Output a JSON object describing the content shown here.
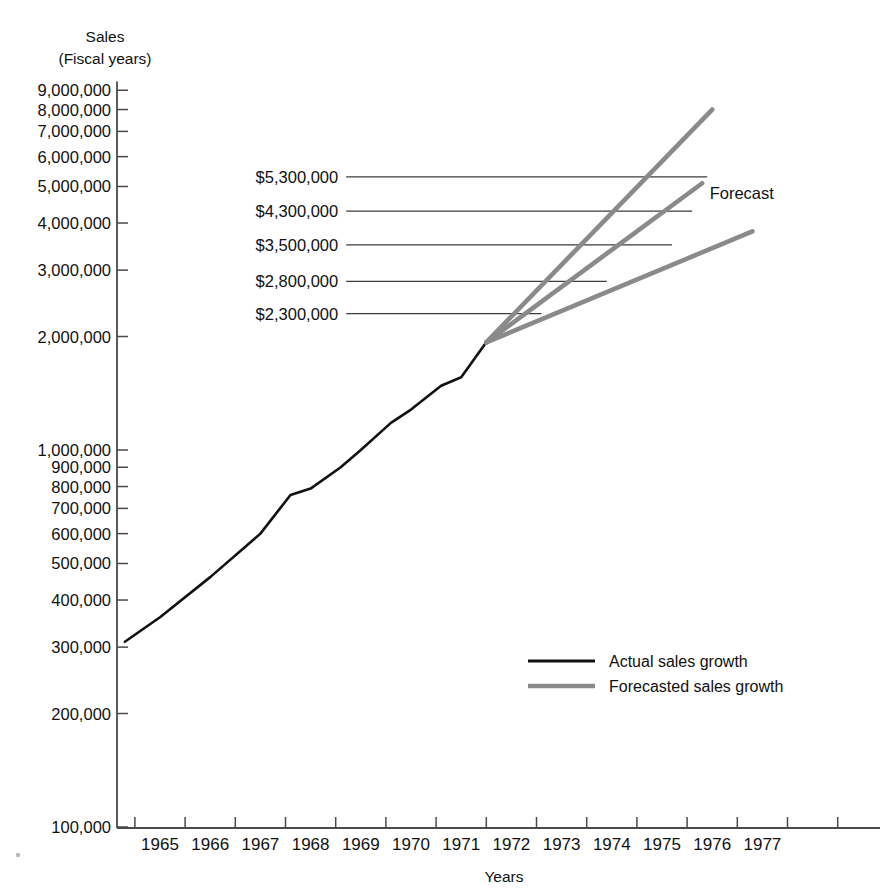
{
  "chart_data": {
    "type": "line",
    "title": "",
    "ylabel": "Sales (Fiscal years)",
    "ylabel_line1": "Sales",
    "ylabel_line2": "(Fiscal years)",
    "xlabel": "Years",
    "yscale": "log",
    "ylim": [
      100000,
      9500000
    ],
    "xlim": [
      1964.2,
      1978.0
    ],
    "grid": false,
    "legend_position": "bottom-right",
    "y_ticks": [
      {
        "value": 9000000,
        "label": "9,000,000"
      },
      {
        "value": 8000000,
        "label": "8,000,000"
      },
      {
        "value": 7000000,
        "label": "7,000,000"
      },
      {
        "value": 6000000,
        "label": "6,000,000"
      },
      {
        "value": 5000000,
        "label": "5,000,000"
      },
      {
        "value": 4000000,
        "label": "4,000,000"
      },
      {
        "value": 3000000,
        "label": "3,000,000"
      },
      {
        "value": 2000000,
        "label": "2,000,000"
      },
      {
        "value": 1000000,
        "label": "1,000,000"
      },
      {
        "value": 900000,
        "label": "900,000"
      },
      {
        "value": 800000,
        "label": "800,000"
      },
      {
        "value": 700000,
        "label": "700,000"
      },
      {
        "value": 600000,
        "label": "600,000"
      },
      {
        "value": 500000,
        "label": "500,000"
      },
      {
        "value": 400000,
        "label": "400,000"
      },
      {
        "value": 300000,
        "label": "300,000"
      },
      {
        "value": 200000,
        "label": "200,000"
      },
      {
        "value": 100000,
        "label": "100,000"
      }
    ],
    "x_ticks": [
      {
        "value": 1965,
        "label": "1965"
      },
      {
        "value": 1966,
        "label": "1966"
      },
      {
        "value": 1967,
        "label": "1967"
      },
      {
        "value": 1968,
        "label": "1968"
      },
      {
        "value": 1969,
        "label": "1969"
      },
      {
        "value": 1970,
        "label": "1970"
      },
      {
        "value": 1971,
        "label": "1971"
      },
      {
        "value": 1972,
        "label": "1972"
      },
      {
        "value": 1973,
        "label": "1973"
      },
      {
        "value": 1974,
        "label": "1974"
      },
      {
        "value": 1975,
        "label": "1975"
      },
      {
        "value": 1976,
        "label": "1976"
      },
      {
        "value": 1977,
        "label": "1977"
      }
    ],
    "series": [
      {
        "name": "Actual sales growth",
        "kind": "actual",
        "color": "#111111",
        "points": [
          {
            "x": 1964.3,
            "y": 310000
          },
          {
            "x": 1965.0,
            "y": 360000
          },
          {
            "x": 1966.0,
            "y": 460000
          },
          {
            "x": 1967.0,
            "y": 600000
          },
          {
            "x": 1967.6,
            "y": 760000
          },
          {
            "x": 1968.0,
            "y": 790000
          },
          {
            "x": 1968.6,
            "y": 900000
          },
          {
            "x": 1969.0,
            "y": 1000000
          },
          {
            "x": 1969.6,
            "y": 1180000
          },
          {
            "x": 1970.0,
            "y": 1280000
          },
          {
            "x": 1970.6,
            "y": 1480000
          },
          {
            "x": 1971.0,
            "y": 1560000
          },
          {
            "x": 1971.5,
            "y": 1930000
          }
        ]
      },
      {
        "name": "Forecasted sales growth (high)",
        "kind": "forecast",
        "color": "#8a8a8a",
        "points": [
          {
            "x": 1971.5,
            "y": 1930000
          },
          {
            "x": 1976.0,
            "y": 8000000
          }
        ]
      },
      {
        "name": "Forecasted sales growth (middle)",
        "kind": "forecast",
        "color": "#8a8a8a",
        "points": [
          {
            "x": 1971.5,
            "y": 1930000
          },
          {
            "x": 1975.8,
            "y": 5100000
          }
        ]
      },
      {
        "name": "Forecasted sales growth (low)",
        "kind": "forecast",
        "color": "#8a8a8a",
        "points": [
          {
            "x": 1971.5,
            "y": 1930000
          },
          {
            "x": 1976.8,
            "y": 3800000
          }
        ]
      }
    ],
    "annotations": [
      {
        "label": "$5,300,000",
        "value": 5300000,
        "label_x": 1968.55,
        "leader_to_x": 1975.9
      },
      {
        "label": "$4,300,000",
        "value": 4300000,
        "label_x": 1968.55,
        "leader_to_x": 1975.6
      },
      {
        "label": "$3,500,000",
        "value": 3500000,
        "label_x": 1968.55,
        "leader_to_x": 1975.2
      },
      {
        "label": "$2,800,000",
        "value": 2800000,
        "label_x": 1968.55,
        "leader_to_x": 1973.9
      },
      {
        "label": "$2,300,000",
        "value": 2300000,
        "label_x": 1968.55,
        "leader_to_x": 1972.6
      }
    ],
    "callout": {
      "label": "Forecast",
      "x": 1975.95,
      "value": 4800000
    },
    "legend": [
      {
        "label": "Actual sales growth",
        "color": "#111111",
        "kind": "actual"
      },
      {
        "label": "Forecasted sales growth",
        "color": "#8a8a8a",
        "kind": "forecast"
      }
    ]
  }
}
